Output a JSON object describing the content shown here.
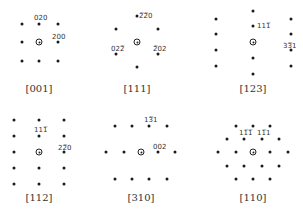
{
  "patterns": [
    {
      "zone_axis": "[001]",
      "center": [
        39,
        42
      ],
      "label_pos": [
        39,
        85
      ],
      "spots": [
        [
          22,
          24
        ],
        [
          39,
          24
        ],
        [
          58,
          24
        ],
        [
          22,
          42
        ],
        [
          58,
          42
        ],
        [
          22,
          61
        ],
        [
          39,
          61
        ],
        [
          58,
          61
        ]
      ],
      "indices": [
        {
          "text": "020",
          "x": 34,
          "y": 15
        },
        {
          "text": "200",
          "x": 52,
          "y": 34
        }
      ]
    },
    {
      "zone_axis": "[111]",
      "center": [
        137,
        42
      ],
      "label_pos": [
        137,
        85
      ],
      "spots": [
        [
          137,
          16
        ],
        [
          116,
          29
        ],
        [
          158,
          29
        ],
        [
          116,
          54
        ],
        [
          158,
          54
        ],
        [
          137,
          67
        ]
      ],
      "indices": [
        {
          "text": "2̅2̅0",
          "x": 139,
          "y": 13
        },
        {
          "text": "022̅",
          "x": 111,
          "y": 46
        },
        {
          "text": "2̅02",
          "x": 153,
          "y": 46
        }
      ]
    },
    {
      "zone_axis": "[123]",
      "center": [
        253,
        42
      ],
      "label_pos": [
        253,
        85
      ],
      "spots": [
        [
          253,
          11
        ],
        [
          253,
          26
        ],
        [
          253,
          58
        ],
        [
          253,
          74
        ],
        [
          216,
          19
        ],
        [
          216,
          34
        ],
        [
          216,
          50
        ],
        [
          216,
          66
        ],
        [
          291,
          19
        ],
        [
          291,
          34
        ],
        [
          291,
          50
        ],
        [
          291,
          66
        ]
      ],
      "indices": [
        {
          "text": "111̅",
          "x": 257,
          "y": 23
        },
        {
          "text": "33̅1",
          "x": 283,
          "y": 43
        }
      ]
    },
    {
      "zone_axis": "[112]",
      "center": [
        39,
        152
      ],
      "label_pos": [
        39,
        194
      ],
      "spots": [
        [
          14,
          120
        ],
        [
          39,
          120
        ],
        [
          64,
          120
        ],
        [
          14,
          136
        ],
        [
          39,
          136
        ],
        [
          64,
          136
        ],
        [
          14,
          152
        ],
        [
          64,
          152
        ],
        [
          14,
          168
        ],
        [
          39,
          168
        ],
        [
          64,
          168
        ],
        [
          14,
          184
        ],
        [
          39,
          184
        ],
        [
          64,
          184
        ]
      ],
      "indices": [
        {
          "text": "111̅",
          "x": 34,
          "y": 127
        },
        {
          "text": "22̅0",
          "x": 58,
          "y": 145
        }
      ]
    },
    {
      "zone_axis": "[310]",
      "center": [
        141,
        152
      ],
      "label_pos": [
        141,
        194
      ],
      "spots": [
        [
          115,
          126
        ],
        [
          132,
          126
        ],
        [
          149,
          126
        ],
        [
          167,
          126
        ],
        [
          106,
          152
        ],
        [
          124,
          152
        ],
        [
          158,
          152
        ],
        [
          175,
          152
        ],
        [
          115,
          179
        ],
        [
          132,
          179
        ],
        [
          149,
          179
        ],
        [
          167,
          179
        ]
      ],
      "indices": [
        {
          "text": "13̅1",
          "x": 144,
          "y": 117
        },
        {
          "text": "002",
          "x": 153,
          "y": 144
        }
      ]
    },
    {
      "zone_axis": "[110]",
      "center": [
        253,
        152
      ],
      "label_pos": [
        253,
        194
      ],
      "spots": [
        [
          236,
          126
        ],
        [
          253,
          126
        ],
        [
          270,
          126
        ],
        [
          227,
          139
        ],
        [
          244,
          139
        ],
        [
          262,
          139
        ],
        [
          279,
          139
        ],
        [
          218,
          152
        ],
        [
          236,
          152
        ],
        [
          270,
          152
        ],
        [
          288,
          152
        ],
        [
          227,
          166
        ],
        [
          244,
          166
        ],
        [
          262,
          166
        ],
        [
          279,
          166
        ],
        [
          236,
          179
        ],
        [
          253,
          179
        ],
        [
          270,
          179
        ]
      ],
      "indices": [
        {
          "text": "11̅1̅",
          "x": 239,
          "y": 130
        },
        {
          "text": "11̅1",
          "x": 257,
          "y": 130
        }
      ]
    }
  ]
}
